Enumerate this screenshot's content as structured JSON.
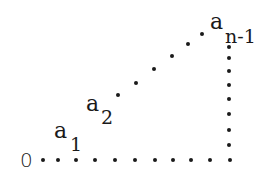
{
  "diagram": {
    "title": "",
    "labels": {
      "origin": "0",
      "a1": {
        "base": "a",
        "sub": "1"
      },
      "a2": {
        "base": "a",
        "sub": "2"
      },
      "an1": {
        "base": "a",
        "sub": "n-1"
      }
    },
    "dot_color": "#1a1a1a",
    "dot_radius": 2,
    "dots": {
      "bottom_row": [
        [
          43,
          160
        ],
        [
          58,
          160
        ],
        [
          76,
          160
        ],
        [
          95,
          160
        ],
        [
          115,
          160
        ],
        [
          135,
          160
        ],
        [
          155,
          160
        ],
        [
          173,
          160
        ],
        [
          191,
          160
        ],
        [
          210,
          160
        ],
        [
          230,
          160
        ]
      ],
      "vertical_column": [
        [
          229,
          47
        ],
        [
          229,
          58
        ],
        [
          229,
          71
        ],
        [
          229,
          85
        ],
        [
          229,
          99
        ],
        [
          229,
          114
        ],
        [
          229,
          130
        ],
        [
          229,
          145
        ]
      ],
      "diagonal": [
        [
          118,
          95
        ],
        [
          136,
          83
        ],
        [
          154,
          69
        ],
        [
          172,
          56
        ],
        [
          188,
          44
        ],
        [
          202,
          34
        ]
      ]
    }
  }
}
